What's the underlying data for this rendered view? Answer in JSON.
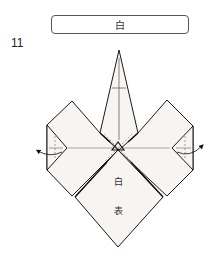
{
  "step": {
    "number": "11"
  },
  "color_label": {
    "text": "白"
  },
  "diagram": {
    "paper_color": "#f8f4f1",
    "line_color": "#1a1a1a",
    "crease_color": "#888888",
    "face_labels": {
      "upper": "白",
      "lower": "表"
    },
    "arrows": {
      "left": "fold-back-arrow-left",
      "right": "fold-back-arrow-right"
    }
  }
}
